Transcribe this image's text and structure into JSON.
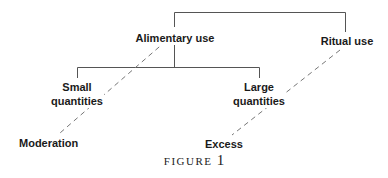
{
  "diagram": {
    "nodes": {
      "alimentary_use": "Alimentary use",
      "ritual_use": "Ritual use",
      "small_quantities_line1": "Small",
      "small_quantities_line2": "quantities",
      "large_quantities_line1": "Large",
      "large_quantities_line2": "quantities",
      "moderation": "Moderation",
      "excess": "Excess"
    },
    "edges_solid": [
      {
        "from": "root",
        "to": "Alimentary use"
      },
      {
        "from": "root",
        "to": "Ritual use"
      },
      {
        "from": "Alimentary use",
        "to": "Small quantities"
      },
      {
        "from": "Alimentary use",
        "to": "Large quantities"
      }
    ],
    "edges_dashed": [
      {
        "from": "Alimentary use",
        "to": "Moderation"
      },
      {
        "from": "Ritual use",
        "to": "Excess"
      }
    ],
    "caption": {
      "word": "FIGURE",
      "number": "1"
    }
  }
}
